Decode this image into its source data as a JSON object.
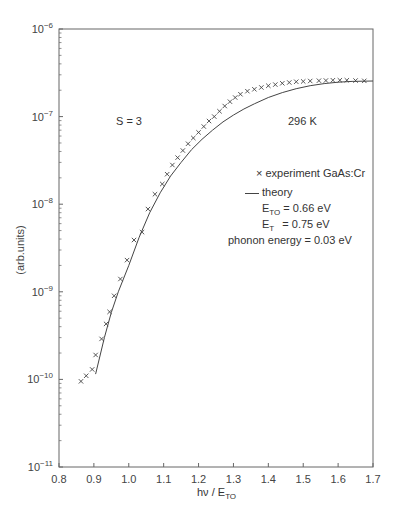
{
  "chart_data": {
    "type": "scatter",
    "title": "",
    "xlabel": "hν / E_TO",
    "ylabel": "(arb.units)",
    "xlim": [
      0.8,
      1.7
    ],
    "ylim": [
      1e-11,
      1e-06
    ],
    "yscale": "log",
    "grid": false,
    "x_ticks": [
      "0.8",
      "0.9",
      "1.0",
      "1.1",
      "1.2",
      "1.3",
      "1.4",
      "1.5",
      "1.6",
      "1.7"
    ],
    "y_ticks": [
      "10^-11",
      "10^-10",
      "10^-9",
      "10^-8",
      "10^-7",
      "10^-6"
    ],
    "annotations": [
      "S = 3",
      "296 K",
      "E_TO = 0.66 eV",
      "E_T = 0.75 eV",
      "phonon energy = 0.03 eV"
    ],
    "legend": [
      "× experiment GaAs:Cr",
      "— theory"
    ],
    "series": [
      {
        "name": "experiment GaAs:Cr",
        "marker": "x",
        "x": [
          0.863,
          0.878,
          0.895,
          0.905,
          0.922,
          0.935,
          0.945,
          0.958,
          0.976,
          0.995,
          1.015,
          1.038,
          1.055,
          1.075,
          1.096,
          1.11,
          1.125,
          1.14,
          1.155,
          1.17,
          1.185,
          1.2,
          1.215,
          1.23,
          1.245,
          1.26,
          1.275,
          1.29,
          1.305,
          1.32,
          1.34,
          1.36,
          1.38,
          1.4,
          1.42,
          1.44,
          1.46,
          1.48,
          1.5,
          1.52,
          1.545,
          1.565,
          1.585,
          1.605,
          1.625,
          1.65,
          1.675
        ],
        "y": [
          9.5e-11,
          1.1e-10,
          1.3e-10,
          1.9e-10,
          2.9e-10,
          4.3e-10,
          5.9e-10,
          9e-10,
          1.4e-09,
          2.3e-09,
          3.9e-09,
          4.8e-09,
          8.8e-09,
          1.3e-08,
          1.7e-08,
          2.2e-08,
          2.8e-08,
          3.4e-08,
          4.1e-08,
          4.9e-08,
          5.7e-08,
          6.6e-08,
          7.7e-08,
          8.9e-08,
          1e-07,
          1.15e-07,
          1.32e-07,
          1.48e-07,
          1.65e-07,
          1.8e-07,
          1.95e-07,
          2.05e-07,
          2.15e-07,
          2.25e-07,
          2.32e-07,
          2.4e-07,
          2.45e-07,
          2.5e-07,
          2.52e-07,
          2.55e-07,
          2.57e-07,
          2.58e-07,
          2.6e-07,
          2.6e-07,
          2.6e-07,
          2.58e-07,
          2.56e-07
        ]
      },
      {
        "name": "theory",
        "marker": "line",
        "x": [
          0.905,
          0.93,
          0.95,
          0.97,
          1.0,
          1.03,
          1.06,
          1.09,
          1.12,
          1.15,
          1.18,
          1.21,
          1.24,
          1.27,
          1.3,
          1.33,
          1.36,
          1.4,
          1.44,
          1.48,
          1.52,
          1.56,
          1.6,
          1.64,
          1.7
        ],
        "y": [
          1.15e-10,
          3e-10,
          5.8e-10,
          1e-09,
          2e-09,
          4.2e-09,
          8e-09,
          1.35e-08,
          2.1e-08,
          3e-08,
          4.2e-08,
          5.5e-08,
          7e-08,
          8.7e-08,
          1.04e-07,
          1.22e-07,
          1.4e-07,
          1.65e-07,
          1.88e-07,
          2.08e-07,
          2.25e-07,
          2.38e-07,
          2.47e-07,
          2.52e-07,
          2.55e-07
        ]
      }
    ]
  },
  "labels": {
    "s_value": "S = 3",
    "temperature": "296 K",
    "legend_experiment": "× experiment GaAs:Cr",
    "legend_theory": "theory",
    "eto_sym": "E",
    "eto_sub": "TO",
    "eto_val": " = 0.66 eV",
    "et_sym": "E",
    "et_sub": "T",
    "et_val": " = 0.75 eV",
    "phonon": "phonon energy = 0.03 eV",
    "xlabel_main": "hν / E",
    "xlabel_sub": "TO",
    "ylabel": "(arb.units)"
  },
  "colors": {
    "axis": "#666666",
    "data": "#444444",
    "text": "#333333"
  }
}
